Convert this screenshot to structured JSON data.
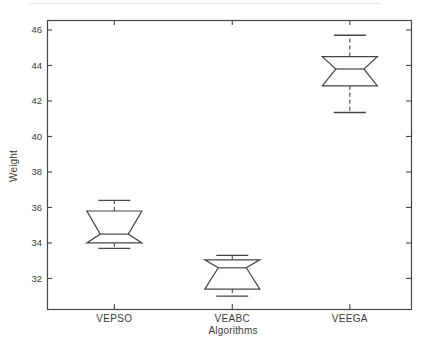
{
  "chart_data": {
    "type": "boxplot",
    "title": "",
    "xlabel": "Algorithms",
    "ylabel": "Weight",
    "categories": [
      "VEPSO",
      "VEABC",
      "VEEGA"
    ],
    "y_ticks": [
      32,
      34,
      36,
      38,
      40,
      42,
      44,
      46
    ],
    "ylim": [
      30.28,
      46.56
    ],
    "notched": true,
    "grid": false,
    "legend": "none",
    "boxes": [
      {
        "label": "VEPSO",
        "whisker_low": 33.7,
        "q1": 34.0,
        "median": 34.5,
        "q3": 35.8,
        "whisker_high": 36.4
      },
      {
        "label": "VEABC",
        "whisker_low": 31.0,
        "q1": 31.4,
        "median": 32.6,
        "q3": 33.05,
        "whisker_high": 33.3
      },
      {
        "label": "VEEGA",
        "whisker_low": 41.35,
        "q1": 42.85,
        "median": 43.8,
        "q3": 44.5,
        "whisker_high": 45.7
      }
    ],
    "line_color": "#454545",
    "text_color": "#3b3b3b",
    "background_color": "#ffffff"
  }
}
